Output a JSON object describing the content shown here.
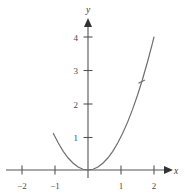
{
  "figure": {
    "title": "",
    "background_color": "#ffffff",
    "curve_color": "#6e6e6e",
    "axis_color": "#555555",
    "label_color": "#4a4a4a"
  },
  "axes": {
    "x_label": "x",
    "y_label": "y",
    "x_ticks": [
      {
        "value": -2,
        "label": "−2"
      },
      {
        "value": -1,
        "label": "−1"
      },
      {
        "value": 1,
        "label": "1"
      },
      {
        "value": 2,
        "label": "2"
      }
    ],
    "y_ticks": [
      {
        "value": 1,
        "label": "1"
      },
      {
        "value": 2,
        "label": "2"
      },
      {
        "value": 3,
        "label": "3"
      },
      {
        "value": 4,
        "label": "4"
      }
    ]
  },
  "chart_data": {
    "type": "line",
    "title": "",
    "xlabel": "x",
    "ylabel": "y",
    "xlim": [
      -2.6,
      2.45
    ],
    "ylim": [
      -0.45,
      4.6
    ],
    "grid": false,
    "legend": null,
    "x_ticks": [
      -2,
      -1,
      1,
      2
    ],
    "x_tick_labels": [
      "−2",
      "−1",
      "1",
      "2"
    ],
    "y_ticks": [
      1,
      2,
      3,
      4
    ],
    "y_tick_labels": [
      "1",
      "2",
      "3",
      "4"
    ],
    "series": [
      {
        "name": "y = x²",
        "expression": "y = x^2",
        "x": [
          -1.05,
          -0.9,
          -0.75,
          -0.6,
          -0.45,
          -0.3,
          -0.15,
          0.0,
          0.15,
          0.3,
          0.45,
          0.6,
          0.75,
          0.9,
          1.05,
          1.2,
          1.35,
          1.5,
          1.65,
          1.8,
          1.95,
          2.0
        ],
        "y": [
          1.1,
          0.81,
          0.5625,
          0.36,
          0.2025,
          0.09,
          0.0225,
          0.0,
          0.0225,
          0.09,
          0.2025,
          0.36,
          0.5625,
          0.81,
          1.1025,
          1.44,
          1.8225,
          2.25,
          2.7225,
          3.24,
          3.8025,
          4.0
        ]
      }
    ],
    "annotations": [
      {
        "name": "curve-point-marker",
        "x": 1.63,
        "y": 2.66,
        "label": ""
      }
    ]
  }
}
